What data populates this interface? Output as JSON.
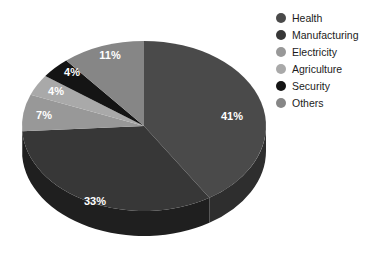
{
  "chart_data": {
    "type": "pie",
    "title": "",
    "subtitle": "",
    "xlabel": "",
    "ylabel": "",
    "legend_position": "right",
    "grid": false,
    "three_d": true,
    "start_angle_deg": 0,
    "direction": "clockwise",
    "categories": [
      "Health",
      "Manufacturing",
      "Electricity",
      "Agriculture",
      "Security",
      "Others"
    ],
    "values": [
      41,
      33,
      7,
      4,
      4,
      11
    ],
    "value_unit": "%",
    "data_labels": [
      "41%",
      "33%",
      "7%",
      "4%",
      "4%",
      "11%"
    ],
    "colors": [
      "#4a4a4a",
      "#373737",
      "#989898",
      "#a9a9a9",
      "#141414",
      "#868686"
    ],
    "slices": [
      {
        "label": "Health",
        "value": 41,
        "display": "41%",
        "color": "#4a4a4a",
        "side_color": "#2e2e2e"
      },
      {
        "label": "Manufacturing",
        "value": 33,
        "display": "33%",
        "color": "#373737",
        "side_color": "#1f1f1f"
      },
      {
        "label": "Electricity",
        "value": 7,
        "display": "7%",
        "color": "#989898",
        "side_color": "#5e5e5e"
      },
      {
        "label": "Agriculture",
        "value": 4,
        "display": "4%",
        "color": "#a9a9a9",
        "side_color": "#6a6a6a"
      },
      {
        "label": "Security",
        "value": 4,
        "display": "4%",
        "color": "#141414",
        "side_color": "#0b0b0b"
      },
      {
        "label": "Others",
        "value": 11,
        "display": "11%",
        "color": "#868686",
        "side_color": "#545454"
      }
    ]
  },
  "legend": {
    "items": [
      {
        "label": "Health",
        "color": "#4a4a4a"
      },
      {
        "label": "Manufacturing",
        "color": "#373737"
      },
      {
        "label": "Electricity",
        "color": "#989898"
      },
      {
        "label": "Agriculture",
        "color": "#a9a9a9"
      },
      {
        "label": "Security",
        "color": "#141414"
      },
      {
        "label": "Others",
        "color": "#868686"
      }
    ]
  },
  "labels": {
    "health": "41%",
    "manufacturing": "33%",
    "electricity": "7%",
    "agriculture": "4%",
    "security": "4%",
    "others": "11%"
  },
  "colors": {
    "background": "#ffffff",
    "label_text": "#ffffff",
    "legend_text": "#1b1b1b"
  }
}
